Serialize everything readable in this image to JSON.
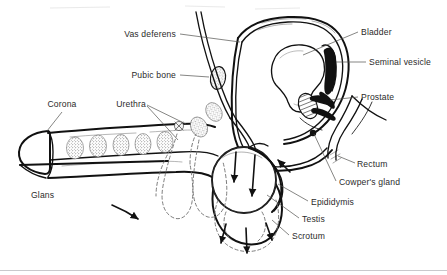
{
  "figure": {
    "background_color": "#ffffff",
    "ink_color": "#111111",
    "label_color": "#2b2b2b",
    "leader_color": "#52524f",
    "dashed_color": "#6e6e6e"
  },
  "labels": [
    {
      "id": "vas-deferens",
      "text": "Vas deferens",
      "anchor": "end",
      "x": 176,
      "y": 37,
      "leader": "M180,34 L240,42"
    },
    {
      "id": "pubic-bone",
      "text": "Pubic bone",
      "anchor": "end",
      "x": 176,
      "y": 78,
      "leader": "M180,75 L208,77"
    },
    {
      "id": "corona",
      "text": "Corona",
      "anchor": "middle",
      "x": 62,
      "y": 107,
      "leader": "M62,111 L47,131"
    },
    {
      "id": "urethra",
      "text": "Urethra",
      "anchor": "middle",
      "x": 131,
      "y": 107,
      "leader": "M147,106 L186,124"
    },
    {
      "id": "glans",
      "text": "Glans",
      "anchor": "start",
      "x": 31,
      "y": 198,
      "leader": ""
    },
    {
      "id": "bladder",
      "text": "Bladder",
      "anchor": "start",
      "x": 361,
      "y": 35,
      "leader": "M358,32 L305,55"
    },
    {
      "id": "seminal-vesicle",
      "text": "Seminal vesicle",
      "anchor": "start",
      "x": 369,
      "y": 65,
      "leader": "M366,62 L334,62"
    },
    {
      "id": "prostate",
      "text": "Prostate",
      "anchor": "start",
      "x": 361,
      "y": 100,
      "leader": "M358,97 L332,99"
    },
    {
      "id": "rectum",
      "text": "Rectum",
      "anchor": "start",
      "x": 357,
      "y": 167,
      "leader": "M355,164 L337,159"
    },
    {
      "id": "cowpers-gland",
      "text": "Cowper's gland",
      "anchor": "start",
      "x": 339,
      "y": 185,
      "leader": "M336,182 L313,133"
    },
    {
      "id": "epididymis",
      "text": "Epididymis",
      "anchor": "start",
      "x": 311,
      "y": 205,
      "leader": "M308,202 L276,186"
    },
    {
      "id": "testis",
      "text": "Testis",
      "anchor": "start",
      "x": 302,
      "y": 222,
      "leader": "M299,219 L268,196"
    },
    {
      "id": "scrotum",
      "text": "Scrotum",
      "anchor": "start",
      "x": 292,
      "y": 239,
      "leader": "M289,236 L273,221"
    }
  ],
  "structures": [
    {
      "id": "penis-shaft",
      "name": "penis shaft"
    },
    {
      "id": "glans-penis",
      "name": "glans penis"
    },
    {
      "id": "corpus-cavernosum",
      "name": "corpus cavernosum stipple segments",
      "count": 6
    },
    {
      "id": "pubic-bone-oval",
      "name": "pubic bone cross-section"
    },
    {
      "id": "bladder-outline",
      "name": "bladder"
    },
    {
      "id": "seminal-vesicle-body",
      "name": "seminal vesicle"
    },
    {
      "id": "prostate-body",
      "name": "prostate"
    },
    {
      "id": "rectum-curve",
      "name": "rectum"
    },
    {
      "id": "cowpers-gland-body",
      "name": "Cowper's gland"
    },
    {
      "id": "testis-body",
      "name": "testis"
    },
    {
      "id": "epididymis-body",
      "name": "epididymis"
    },
    {
      "id": "scrotum-outline",
      "name": "scrotum"
    },
    {
      "id": "scrotum-dashed",
      "name": "scrotum alternate position (dashed)"
    },
    {
      "id": "vas-deferens-tube",
      "name": "vas deferens duct"
    },
    {
      "id": "direction-arrow",
      "name": "flow direction arrow"
    }
  ],
  "arrows": [
    {
      "id": "arrow-testis-left",
      "style": "solid",
      "direction": "down"
    },
    {
      "id": "arrow-testis-right",
      "style": "solid",
      "direction": "down"
    },
    {
      "id": "arrow-epididymis-up",
      "style": "solid",
      "direction": "up-left"
    },
    {
      "id": "arrow-scrotum-left",
      "style": "solid",
      "direction": "down-left"
    },
    {
      "id": "arrow-scrotum-mid",
      "style": "solid",
      "direction": "down"
    },
    {
      "id": "arrow-scrotum-right",
      "style": "solid",
      "direction": "down-right"
    },
    {
      "id": "arrow-penis-direction",
      "style": "curved",
      "direction": "right"
    }
  ]
}
